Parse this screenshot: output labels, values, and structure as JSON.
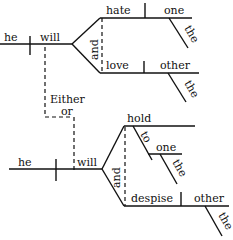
{
  "diagram": {
    "type": "sentence-diagram",
    "clause1": {
      "subject": "he",
      "verb": "will",
      "conjunction": "and",
      "predicates": [
        {
          "verb": "hate",
          "object": "one",
          "modifier": "the"
        },
        {
          "verb": "love",
          "object": "other",
          "modifier": "the"
        }
      ]
    },
    "connector": {
      "line1": "Either",
      "line2": "or"
    },
    "clause2": {
      "subject": "he",
      "verb": "will",
      "conjunction": "and",
      "predicates": [
        {
          "verb": "hold",
          "preposition": "to",
          "object": "one",
          "modifier": "the"
        },
        {
          "verb": "despise",
          "object": "other",
          "modifier": "the"
        }
      ]
    }
  }
}
